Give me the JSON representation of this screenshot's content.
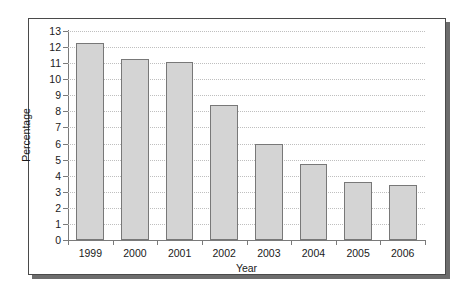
{
  "chart_data": {
    "type": "bar",
    "title": "",
    "xlabel": "Year",
    "ylabel": "Percentage",
    "categories": [
      "1999",
      "2000",
      "2001",
      "2002",
      "2003",
      "2004",
      "2005",
      "2006"
    ],
    "values": [
      12.25,
      11.25,
      11.05,
      8.4,
      6.0,
      4.7,
      3.6,
      3.45
    ],
    "ylim": [
      0,
      13
    ],
    "ytick_labels": [
      "0",
      "1",
      "2",
      "3",
      "4",
      "5",
      "6",
      "7",
      "8",
      "9",
      "10",
      "11",
      "12",
      "13"
    ],
    "ytick_values": [
      0,
      1,
      2,
      3,
      4,
      5,
      6,
      7,
      8,
      9,
      10,
      11,
      12,
      13
    ],
    "grid": "horizontal-dotted",
    "legend": "none",
    "series": [
      {
        "name": "Percentage",
        "values": [
          12.25,
          11.25,
          11.05,
          8.4,
          6.0,
          4.7,
          3.6,
          3.45
        ]
      }
    ],
    "colors": {
      "bar_fill": "#d4d4d4",
      "bar_border": "#787878",
      "gridline": "#bfbfbf",
      "axis": "#7a7a7a",
      "frame": "#4a4a4a",
      "text": "#1a1a1a"
    }
  }
}
